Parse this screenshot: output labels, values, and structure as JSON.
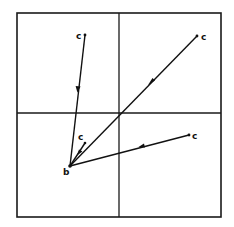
{
  "diagram": {
    "origin_label": "b",
    "endpoint_label": "c",
    "vectors": [
      {
        "id": "upper-left",
        "from_label": "c",
        "to_label": "b",
        "direction": "toward-b",
        "quadrant": "top-left"
      },
      {
        "id": "upper-right",
        "from_label": "c",
        "to_label": "b",
        "direction": "toward-b",
        "quadrant": "top-right"
      },
      {
        "id": "right",
        "from_label": "c",
        "to_label": "b",
        "direction": "toward-b",
        "quadrant": "bottom-right"
      },
      {
        "id": "short",
        "from_label": "c",
        "to_label": "b",
        "direction": "toward-b",
        "quadrant": "bottom-left"
      }
    ],
    "colors": {
      "ink": "#111111",
      "background": "#ffffff"
    }
  }
}
